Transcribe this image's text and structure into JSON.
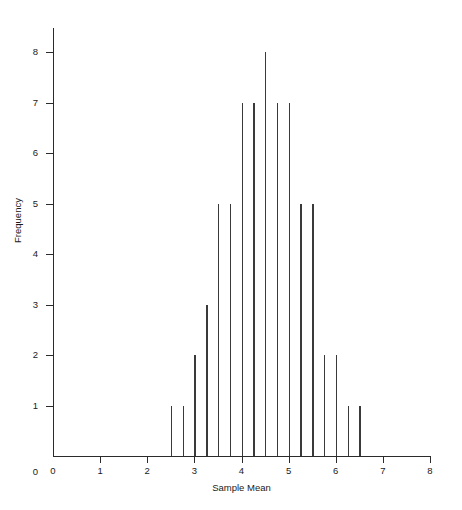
{
  "chart_data": {
    "type": "bar",
    "title": "",
    "subtitle": "",
    "xlabel": "Sample Mean",
    "ylabel": "Frequency",
    "xlim": [
      0,
      8
    ],
    "ylim": [
      0,
      8.5
    ],
    "grid": false,
    "legend": null,
    "bar_style": "needle",
    "bar_spacing": 0.25,
    "x": [
      2.5,
      2.75,
      3.0,
      3.25,
      3.5,
      3.75,
      4.0,
      4.25,
      4.5,
      4.75,
      5.0,
      5.25,
      5.5,
      5.75,
      6.0,
      6.25,
      6.5
    ],
    "categories": [
      "2.50",
      "2.75",
      "3.00",
      "3.25",
      "3.50",
      "3.75",
      "4.00",
      "4.25",
      "4.50",
      "4.75",
      "5.00",
      "5.25",
      "5.50",
      "5.75",
      "6.00",
      "6.25",
      "6.50"
    ],
    "values": [
      1,
      1,
      2,
      3,
      5,
      5,
      7,
      7,
      8,
      7,
      7,
      5,
      5,
      2,
      2,
      1,
      1
    ],
    "x_ticks": [
      0,
      1,
      2,
      3,
      4,
      5,
      6,
      7,
      8
    ],
    "x_tick_labels": [
      "0",
      "1",
      "2",
      "3",
      "4",
      "5",
      "6",
      "7",
      "8"
    ],
    "y_ticks": [
      1,
      2,
      3,
      4,
      5,
      6,
      7,
      8
    ],
    "y_tick_labels": [
      "1",
      "2",
      "3",
      "4",
      "5",
      "6",
      "7",
      "8"
    ],
    "y_origin_label": "0",
    "colors": {
      "bar": "#3a3a3a",
      "axis": "#2b2b2b",
      "text": "#1a1a1a",
      "background": "#ffffff"
    }
  }
}
